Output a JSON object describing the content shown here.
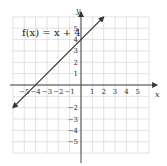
{
  "chart_data": {
    "type": "line",
    "title": "",
    "function_label": "f(x) = x + 4",
    "xlabel": "x",
    "ylabel": "y",
    "xlim": [
      -6,
      6
    ],
    "ylim": [
      -6,
      6
    ],
    "grid": true,
    "x_ticks": [
      -5,
      -4,
      -3,
      -2,
      -1,
      1,
      2,
      3,
      4,
      5
    ],
    "x_tick_labels": [
      "−5",
      "−4",
      "−3",
      "−2",
      "−1",
      "1",
      "2",
      "3",
      "4",
      "5"
    ],
    "y_ticks": [
      5,
      4,
      3,
      2,
      1,
      -2,
      -3,
      -4,
      -5
    ],
    "y_tick_labels": [
      "5",
      "4",
      "3",
      "2",
      "1",
      "−2",
      "−3",
      "−4",
      "−5"
    ],
    "series": [
      {
        "name": "f(x) = x + 4",
        "x": [
          -6,
          2
        ],
        "y": [
          -2,
          6
        ],
        "arrows": "both"
      }
    ],
    "colors": {
      "line": "#333333",
      "grid": "#cfcfcf",
      "axis": "#444444"
    }
  }
}
